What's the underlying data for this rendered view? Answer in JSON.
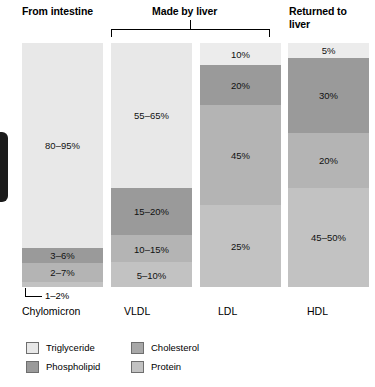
{
  "figure": {
    "headers": [
      {
        "id": "from-intestine",
        "text": "From intestine"
      },
      {
        "id": "made-by-liver",
        "text": "Made by liver"
      },
      {
        "id": "returned-to-liver",
        "text": "Returned to\nliver"
      }
    ],
    "callout": {
      "text": "1–2%",
      "belongs_to": "Chylomicron"
    }
  },
  "legend": {
    "columns": [
      [
        {
          "label": "Triglyceride",
          "color": "#e8e8e8"
        },
        {
          "label": "Phospholipid",
          "color": "#9a9a9a"
        }
      ],
      [
        {
          "label": "Cholesterol",
          "color": "#a8a8a8"
        },
        {
          "label": "Protein",
          "color": "#c2c2c2"
        }
      ]
    ]
  },
  "chart_data": {
    "type": "bar",
    "subtype": "stacked-100-percent",
    "title": "",
    "xlabel": "",
    "ylabel": "",
    "ylim": [
      0,
      100
    ],
    "grid": false,
    "legend_position": "bottom-left",
    "categories": [
      "Chylomicron",
      "VLDL",
      "LDL",
      "HDL"
    ],
    "components": [
      "Triglyceride",
      "Phospholipid",
      "Cholesterol",
      "Protein"
    ],
    "component_colors": {
      "Triglyceride": "#e8e8e8",
      "Phospholipid": "#9a9a9a",
      "Cholesterol": "#a8a8a8",
      "Protein": "#c2c2c2"
    },
    "columns": [
      {
        "name": "Chylomicron",
        "group": "From intestine",
        "bands": [
          {
            "component": "Triglyceride",
            "label": "80–95%",
            "value_low": 80,
            "value_high": 95,
            "height_pct": 84.0,
            "color": "#e8e8e8",
            "label_inside": true
          },
          {
            "component": "Phospholipid",
            "label": "3–6%",
            "value_low": 3,
            "value_high": 6,
            "height_pct": 6.0,
            "color": "#9a9a9a",
            "label_inside": true
          },
          {
            "component": "Cholesterol",
            "label": "2–7%",
            "value_low": 2,
            "value_high": 7,
            "height_pct": 8.0,
            "color": "#b4b4b4",
            "label_inside": true
          },
          {
            "component": "Protein",
            "label": "1–2%",
            "value_low": 1,
            "value_high": 2,
            "height_pct": 2.0,
            "color": "#c2c2c2",
            "label_inside": false
          }
        ]
      },
      {
        "name": "VLDL",
        "group": "Made by liver",
        "bands": [
          {
            "component": "Triglyceride",
            "label": "55–65%",
            "value_low": 55,
            "value_high": 65,
            "height_pct": 59.4,
            "color": "#e8e8e8",
            "label_inside": true
          },
          {
            "component": "Phospholipid",
            "label": "15–20%",
            "value_low": 15,
            "value_high": 20,
            "height_pct": 19.3,
            "color": "#9a9a9a",
            "label_inside": true
          },
          {
            "component": "Cholesterol",
            "label": "10–15%",
            "value_low": 10,
            "value_high": 15,
            "height_pct": 11.1,
            "color": "#b4b4b4",
            "label_inside": true
          },
          {
            "component": "Protein",
            "label": "5–10%",
            "value_low": 5,
            "value_high": 10,
            "height_pct": 10.2,
            "color": "#c2c2c2",
            "label_inside": true
          }
        ]
      },
      {
        "name": "LDL",
        "group": "Made by liver",
        "bands": [
          {
            "component": "Triglyceride",
            "label": "10%",
            "value_low": 10,
            "value_high": 10,
            "height_pct": 9.0,
            "color": "#ececec",
            "label_inside": true
          },
          {
            "component": "Phospholipid",
            "label": "20%",
            "value_low": 20,
            "value_high": 20,
            "height_pct": 16.4,
            "color": "#9a9a9a",
            "label_inside": true
          },
          {
            "component": "Cholesterol",
            "label": "45%",
            "value_low": 45,
            "value_high": 45,
            "height_pct": 41.0,
            "color": "#b4b4b4",
            "label_inside": true
          },
          {
            "component": "Protein",
            "label": "25%",
            "value_low": 25,
            "value_high": 25,
            "height_pct": 33.6,
            "color": "#c2c2c2",
            "label_inside": true
          }
        ]
      },
      {
        "name": "HDL",
        "group": "Returned to liver",
        "bands": [
          {
            "component": "Triglyceride",
            "label": "5%",
            "value_low": 5,
            "value_high": 5,
            "height_pct": 6.1,
            "color": "#ececec",
            "label_inside": true
          },
          {
            "component": "Phospholipid",
            "label": "30%",
            "value_low": 30,
            "value_high": 30,
            "height_pct": 30.7,
            "color": "#9a9a9a",
            "label_inside": true
          },
          {
            "component": "Cholesterol",
            "label": "20%",
            "value_low": 20,
            "value_high": 20,
            "height_pct": 22.5,
            "color": "#b4b4b4",
            "label_inside": true
          },
          {
            "component": "Protein",
            "label": "45–50%",
            "value_low": 45,
            "value_high": 50,
            "height_pct": 40.7,
            "color": "#c2c2c2",
            "label_inside": true
          }
        ]
      }
    ]
  }
}
